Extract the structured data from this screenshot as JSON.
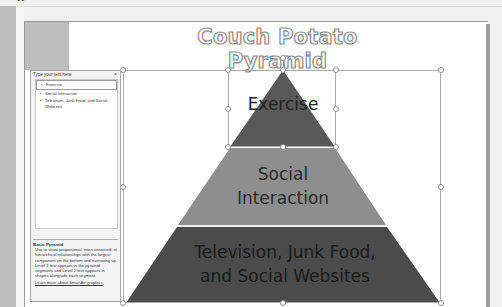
{
  "window": {
    "top_fragment": "••"
  },
  "slide": {
    "title": "Couch Potato Pyramid"
  },
  "smartart": {
    "layout": "Basic Pyramid",
    "segments": [
      {
        "label": "Exercise",
        "color": "#595959"
      },
      {
        "label_line1": "Social",
        "label_line2": "Interaction",
        "color": "#8e8e8e"
      },
      {
        "label_line1": "Television, Junk Food,",
        "label_line2": "and Social Websites",
        "color": "#4b4b4b"
      }
    ]
  },
  "text_pane": {
    "title": "Type your text here",
    "close": "×",
    "items": [
      {
        "bullet": "•",
        "text": "Exercise"
      },
      {
        "bullet": "•",
        "text": "Social Interaction"
      },
      {
        "bullet": "•",
        "text": "Television, Junk Food, and Social Websites"
      }
    ],
    "description_title": "Basic Pyramid",
    "description": "Use to show proportional, interconnected, or hierarchical relationships with the largest component on the bottom and narrowing up. Level 1 text appears in the pyramid segments and Level 2 text appears in shapes alongside each segment.",
    "link": "Learn more about SmartArt graphics"
  }
}
